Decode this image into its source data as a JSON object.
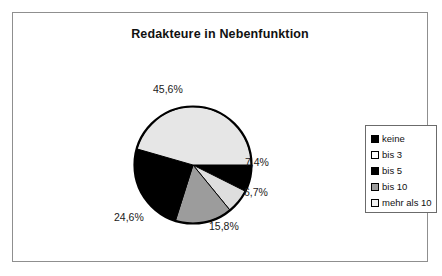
{
  "chart_data": {
    "type": "pie",
    "title": "Redakteure in Nebenfunktion",
    "categories": [
      "keine",
      "bis 3",
      "bis 5",
      "bis 10",
      "mehr als 10"
    ],
    "values": [
      7.4,
      6.7,
      15.8,
      24.6,
      45.6
    ],
    "value_labels": [
      "7,4%",
      "6,7%",
      "15,8%",
      "24,6%",
      "45,6%"
    ],
    "slice_colors": [
      "#000000",
      "#dedede",
      "#9c9c9c",
      "#000000",
      "#e6e6e6"
    ],
    "legend_swatch_colors": [
      "#000000",
      "#ffffff",
      "#000000",
      "#9c9c9c",
      "#f2f2f2"
    ],
    "slice_outline": "#000000",
    "legend_position": "right",
    "start_angle_deg": 0,
    "direction": "clockwise",
    "grid": false,
    "xlabel": "",
    "ylabel": ""
  },
  "legend": {
    "items": [
      {
        "label": "keine"
      },
      {
        "label": "bis 3"
      },
      {
        "label": "bis 5"
      },
      {
        "label": "bis 10"
      },
      {
        "label": "mehr als 10"
      }
    ]
  }
}
